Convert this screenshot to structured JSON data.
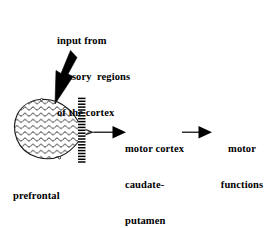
{
  "diagram": {
    "colors": {
      "ink": "#000000",
      "background": "#ffffff"
    },
    "labels": {
      "input_source": {
        "name": "input-from-sensory-regions",
        "lines": [
          "input from",
          "sensory  regions",
          "of the cortex"
        ]
      },
      "motor_cortex": {
        "name": "motor-cortex-caudate-putamen",
        "lines": [
          "motor cortex",
          "caudate-",
          "putamen"
        ]
      },
      "motor_functions": {
        "name": "motor-functions",
        "lines": [
          "motor",
          "functions"
        ]
      },
      "prefrontal": {
        "name": "prefrontal-cortex-filters-out-responses",
        "lines": [
          "prefrontal",
          "cortex",
          "filters out",
          "responses"
        ]
      }
    },
    "shapes": {
      "input_arrow": {
        "name": "input-arrow",
        "description": "thick black arrow pointing down-left into prefrontal cortex blob"
      },
      "prefrontal_blob": {
        "name": "prefrontal-cortex-blob",
        "description": "wavy hatch filled blob with pointed right tip"
      },
      "filter_bar": {
        "name": "filter-bar",
        "description": "vertical striped bar representing the filter",
        "stripe_count": 22
      },
      "arrow_to_motor_cortex": {
        "name": "arrow-to-motor-cortex",
        "description": "thin line with solid triangular head"
      },
      "arrow_to_motor_functions": {
        "name": "arrow-to-motor-functions",
        "description": "thin line with solid triangular head"
      }
    }
  }
}
